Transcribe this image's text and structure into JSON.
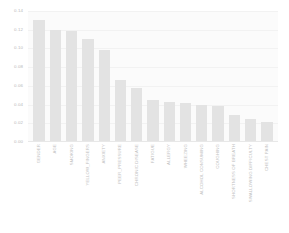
{
  "chart_data": {
    "type": "bar",
    "title": "",
    "subtitle": "",
    "xlabel": "",
    "ylabel": "",
    "ylim": [
      0.0,
      0.14
    ],
    "yticks": [
      "0.00",
      "0.02",
      "0.04",
      "0.06",
      "0.08",
      "0.10",
      "0.12",
      "0.14"
    ],
    "ytick_values": [
      0.0,
      0.02,
      0.04,
      0.06,
      0.08,
      0.1,
      0.12,
      0.14
    ],
    "grid": true,
    "legend": "none",
    "orientation": "vertical",
    "xtick_rotation": -90,
    "bar_color": "#e3e3e3",
    "plot_background": "#fbfbfb",
    "figure_background": "#ffffff",
    "categories": [
      "GENDER",
      "AGE",
      "SMOKING",
      "YELLOW_FINGERS",
      "ANXIETY",
      "PEER_PRESSURE",
      "CHRONIC DISEASE",
      "FATIGUE",
      "ALLERGY",
      "WHEEZING",
      "ALCOHOL CONSUMING",
      "COUGHING",
      "SHORTNESS OF BREATH",
      "SWALLOWING DIFFICULTY",
      "CHEST PAIN"
    ],
    "values": [
      0.13,
      0.12,
      0.119,
      0.11,
      0.098,
      0.066,
      0.058,
      0.045,
      0.043,
      0.042,
      0.04,
      0.039,
      0.029,
      0.025,
      0.021
    ]
  }
}
